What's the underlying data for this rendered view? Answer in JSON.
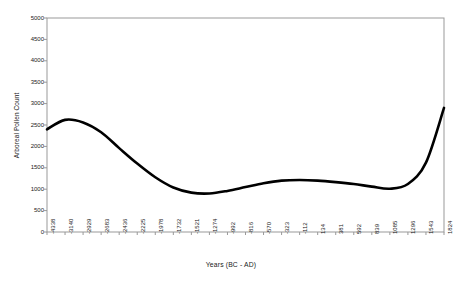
{
  "chart_data": {
    "type": "line",
    "title": "",
    "xlabel": "Years (BC - AD)",
    "ylabel": "Arboreal Pollen Count",
    "ylim": [
      0,
      5000
    ],
    "ytick_step": 500,
    "yticks": [
      "0",
      "500",
      "1000",
      "1500",
      "2000",
      "2500",
      "3000",
      "3500",
      "4000",
      "4500",
      "5000"
    ],
    "grid": false,
    "legend": null,
    "line_color": "#000000",
    "border_color": "#999999",
    "categories": [
      "-4338",
      "-3140",
      "-2929",
      "-2683",
      "-2436",
      "-2225",
      "-1978",
      "-1732",
      "-1521",
      "-1274",
      "-992",
      "-816",
      "-570",
      "-323",
      "-112",
      "134",
      "381",
      "592",
      "839",
      "1085",
      "1296",
      "1543",
      "1824"
    ],
    "values": [
      2400,
      2620,
      2560,
      2330,
      1960,
      1600,
      1280,
      1040,
      920,
      900,
      960,
      1050,
      1140,
      1200,
      1215,
      1200,
      1165,
      1120,
      1060,
      1010,
      1120,
      1620,
      2900
    ]
  },
  "axis": {
    "x_title": "Years (BC - AD)",
    "y_title": "Arboreal Pollen Count"
  }
}
